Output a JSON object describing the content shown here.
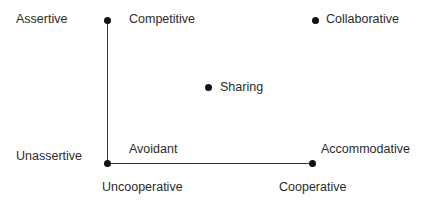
{
  "diagram": {
    "title": "",
    "type": "conflict-style grid (Thomas-Kilmann)",
    "axes": {
      "vertical": {
        "top_label": "Assertive",
        "bottom_label": "Unassertive"
      },
      "horizontal": {
        "left_label": "Uncooperative",
        "right_label": "Cooperative"
      }
    },
    "styles": [
      {
        "name": "Competitive",
        "position": "assertive-uncooperative"
      },
      {
        "name": "Collaborative",
        "position": "assertive-cooperative"
      },
      {
        "name": "Sharing",
        "position": "middle"
      },
      {
        "name": "Avoidant",
        "position": "unassertive-uncooperative"
      },
      {
        "name": "Accommodative",
        "position": "unassertive-cooperative"
      }
    ],
    "colors": {
      "text": "#2b2b2b",
      "line": "#333333",
      "dot": "#111111"
    }
  }
}
